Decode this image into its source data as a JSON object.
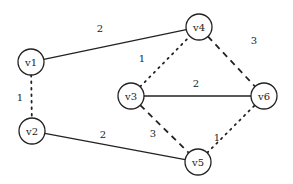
{
  "graph": {
    "node_radius": 13,
    "nodes": [
      {
        "id": "v1",
        "label": "v1",
        "x": 31,
        "y": 62
      },
      {
        "id": "v2",
        "label": "v2",
        "x": 32,
        "y": 131
      },
      {
        "id": "v3",
        "label": "v3",
        "x": 131,
        "y": 96
      },
      {
        "id": "v4",
        "label": "v4",
        "x": 199,
        "y": 27
      },
      {
        "id": "v5",
        "label": "v5",
        "x": 198,
        "y": 162
      },
      {
        "id": "v6",
        "label": "v6",
        "x": 264,
        "y": 96
      }
    ],
    "edges": [
      {
        "from": "v1",
        "to": "v4",
        "weight": "2",
        "style": "solid",
        "label_x": 100,
        "label_y": 28
      },
      {
        "from": "v1",
        "to": "v2",
        "weight": "1",
        "style": "dotted",
        "label_x": 20,
        "label_y": 97
      },
      {
        "from": "v3",
        "to": "v4",
        "weight": "1",
        "style": "dotted",
        "label_x": 142,
        "label_y": 58
      },
      {
        "from": "v4",
        "to": "v6",
        "weight": "3",
        "style": "dashed",
        "label_x": 254,
        "label_y": 40
      },
      {
        "from": "v3",
        "to": "v6",
        "weight": "2",
        "style": "solid",
        "label_x": 196,
        "label_y": 83
      },
      {
        "from": "v3",
        "to": "v5",
        "weight": "3",
        "style": "dashed",
        "label_x": 153,
        "label_y": 133
      },
      {
        "from": "v2",
        "to": "v5",
        "weight": "2",
        "style": "solid",
        "label_x": 103,
        "label_y": 134
      },
      {
        "from": "v5",
        "to": "v6",
        "weight": "1",
        "style": "dotted",
        "label_x": 217,
        "label_y": 137
      }
    ]
  }
}
